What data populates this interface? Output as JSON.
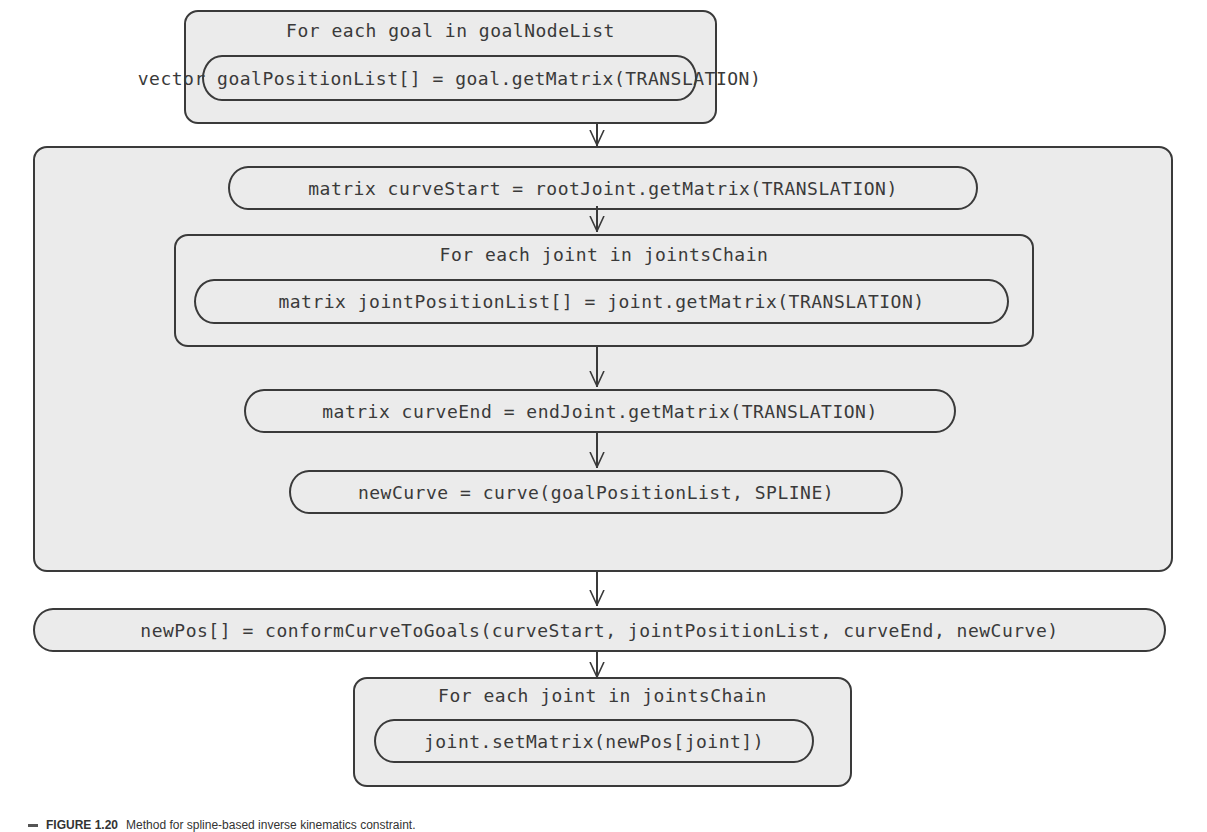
{
  "diagram": {
    "outer_loop": {
      "title": "For each goal in goalNodeList",
      "statement": "vector goalPositionList[] = goal.getMatrix(TRANSLATION)"
    },
    "main_block": {
      "curve_start": "matrix curveStart = rootJoint.getMatrix(TRANSLATION)",
      "joint_loop": {
        "title": "For each joint in jointsChain",
        "statement": "matrix jointPositionList[] = joint.getMatrix(TRANSLATION)"
      },
      "curve_end": "matrix curveEnd = endJoint.getMatrix(TRANSLATION)",
      "new_curve": "newCurve = curve(goalPositionList, SPLINE)"
    },
    "conform": "newPos[] = conformCurveToGoals(curveStart, jointPositionList, curveEnd, newCurve)",
    "set_loop": {
      "title": "For each joint in jointsChain",
      "statement": "joint.setMatrix(newPos[joint])"
    }
  },
  "caption": {
    "label": "FIGURE 1.20",
    "text": "Method for spline-based inverse kinematics constraint."
  },
  "colors": {
    "fill": "#ebebeb",
    "stroke": "#3a3a3a"
  }
}
